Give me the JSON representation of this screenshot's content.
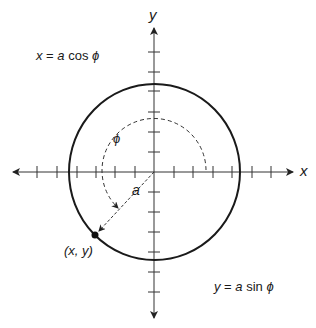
{
  "diagram": {
    "axes": {
      "x_label": "x",
      "y_label": "y"
    },
    "equations": {
      "x_eq": {
        "lhs": "x",
        "eq": " = ",
        "a": "a",
        "fn": " cos ",
        "phi": "ϕ"
      },
      "y_eq": {
        "lhs": "y",
        "eq": " = ",
        "a": "a",
        "fn": " sin ",
        "phi": "ϕ"
      }
    },
    "angle_label": "ϕ",
    "radius_label": "a",
    "point_label": "(x, y)",
    "colors": {
      "stroke": "#1a1a1a",
      "axis": "#333333",
      "background": "#ffffff"
    }
  }
}
